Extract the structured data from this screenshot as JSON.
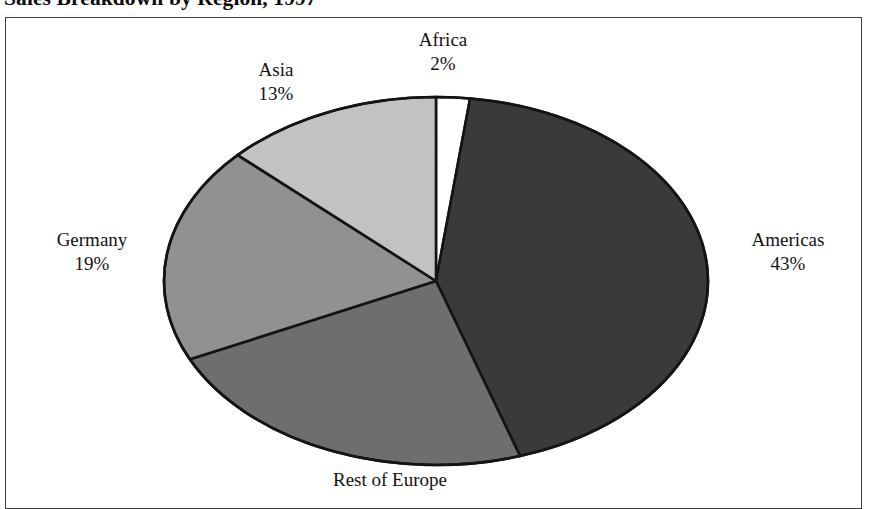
{
  "chart_data": {
    "type": "pie",
    "title": "Sales Breakdown by Region, 1997",
    "xlabel": "",
    "ylabel": "",
    "legend_position": "none",
    "grid": false,
    "start_angle_deg": 0,
    "direction": "clockwise",
    "categories": [
      "Africa",
      "Americas",
      "Rest of Europe",
      "Germany",
      "Asia"
    ],
    "values": [
      2,
      43,
      23,
      19,
      13
    ],
    "value_unit": "%",
    "slices": [
      {
        "name": "Africa",
        "value": 2,
        "label_name": "Africa",
        "label_value": "2%",
        "color": "#ffffff",
        "start_angle": 0,
        "end_angle": 7.2
      },
      {
        "name": "Americas",
        "value": 43,
        "label_name": "Americas",
        "label_value": "43%",
        "color": "#3a3a3a",
        "start_angle": 7.2,
        "end_angle": 162
      },
      {
        "name": "Rest of Europe",
        "value": 23,
        "label_name": "Rest of Europe",
        "label_value": "",
        "color": "#6e6e6e",
        "start_angle": 162,
        "end_angle": 244.8
      },
      {
        "name": "Germany",
        "value": 19,
        "label_name": "Germany",
        "label_value": "19%",
        "color": "#919191",
        "start_angle": 244.8,
        "end_angle": 313.2
      },
      {
        "name": "Asia",
        "value": 13,
        "label_name": "Asia",
        "label_value": "13%",
        "color": "#c2c2c2",
        "start_angle": 313.2,
        "end_angle": 360
      }
    ],
    "colors": {
      "africa": "#ffffff",
      "americas": "#3a3a3a",
      "rest_of_europe": "#6e6e6e",
      "germany": "#919191",
      "asia": "#c2c2c2",
      "slice_outline": "#141414",
      "frame_border": "#3f3f3f",
      "background": "#ffffff",
      "text": "#121212"
    }
  }
}
